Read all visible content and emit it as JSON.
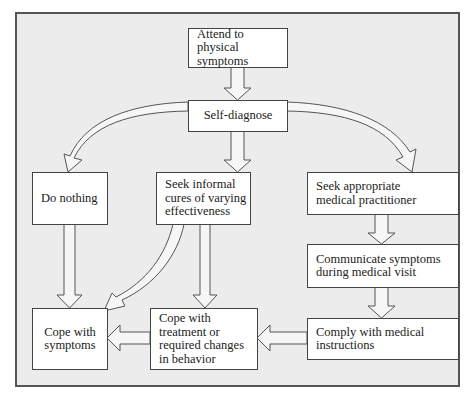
{
  "diagram": {
    "type": "flowchart",
    "colors": {
      "frame_border": "#555555",
      "background": "#ececec",
      "box_fill": "#ffffff",
      "arrow_fill": "#f6f6f6",
      "arrow_stroke": "#555555"
    },
    "nodes": {
      "attend": "Attend to\nphysical symptoms",
      "self_diagnose": "Self-diagnose",
      "do_nothing": "Do nothing",
      "seek_informal": "Seek informal\ncures of varying\neffectiveness",
      "seek_practitioner": "Seek appropriate\nmedical practitioner",
      "communicate": "Communicate symptoms\nduring medical visit",
      "comply": "Comply with medical\ninstructions",
      "cope_symptoms": "Cope with\nsymptoms",
      "cope_treatment": "Cope with\ntreatment or\nrequired changes\nin behavior"
    },
    "edges": [
      {
        "from": "attend",
        "to": "self_diagnose"
      },
      {
        "from": "self_diagnose",
        "to": "do_nothing"
      },
      {
        "from": "self_diagnose",
        "to": "seek_informal"
      },
      {
        "from": "self_diagnose",
        "to": "seek_practitioner"
      },
      {
        "from": "do_nothing",
        "to": "cope_symptoms"
      },
      {
        "from": "seek_informal",
        "to": "cope_symptoms"
      },
      {
        "from": "seek_informal",
        "to": "cope_treatment"
      },
      {
        "from": "seek_practitioner",
        "to": "communicate"
      },
      {
        "from": "communicate",
        "to": "comply"
      },
      {
        "from": "comply",
        "to": "cope_treatment"
      },
      {
        "from": "cope_treatment",
        "to": "cope_symptoms"
      }
    ]
  }
}
